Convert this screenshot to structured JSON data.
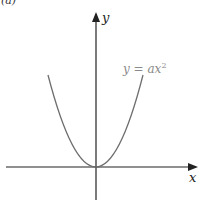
{
  "figure": {
    "panel_label": "(a)",
    "equation_label": "y = ax",
    "equation_exponent": "2",
    "x_axis_label": "x",
    "y_axis_label": "y",
    "colors": {
      "axes": "#222222",
      "curve": "#6e6e6e",
      "equation_text": "#8a8a8a",
      "axis_text": "#222222"
    }
  }
}
